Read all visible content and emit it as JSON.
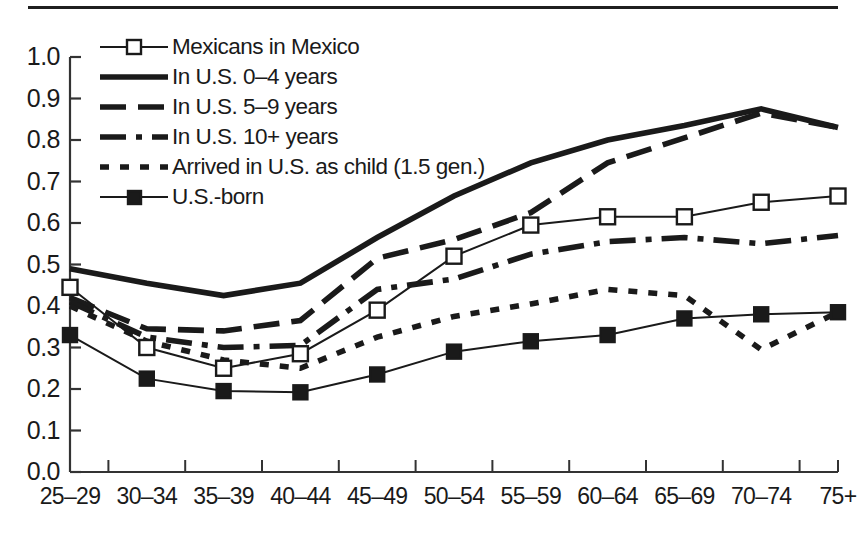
{
  "chart_data": {
    "type": "line",
    "title": "",
    "subtitle": "",
    "xlabel": "",
    "ylabel": "",
    "categories": [
      "25–29",
      "30–34",
      "35–39",
      "40–44",
      "45–49",
      "50–54",
      "55–59",
      "60–64",
      "65–69",
      "70–74",
      "75+"
    ],
    "ylim": [
      0.0,
      1.0
    ],
    "ytick_labels": [
      "0.0",
      "0.1",
      "0.2",
      "0.3",
      "0.4",
      "0.5",
      "0.6",
      "0.7",
      "0.8",
      "0.9",
      "1.0"
    ],
    "ytick_values": [
      0.0,
      0.1,
      0.2,
      0.3,
      0.4,
      0.5,
      0.6,
      0.7,
      0.8,
      0.9,
      1.0
    ],
    "grid": false,
    "legend_position": "upper-left-inside",
    "series": [
      {
        "name": "Mexicans in Mexico",
        "style": "solid-thin-open-square",
        "marker": "open-square",
        "values": [
          0.445,
          0.3,
          0.25,
          0.285,
          0.39,
          0.52,
          0.595,
          0.615,
          0.615,
          0.65,
          0.665
        ]
      },
      {
        "name": "In U.S. 0–4 years",
        "style": "solid-thick",
        "marker": "none",
        "values": [
          0.49,
          0.455,
          0.425,
          0.455,
          0.565,
          0.665,
          0.745,
          0.8,
          0.835,
          0.875,
          0.83
        ]
      },
      {
        "name": "In U.S. 5–9 years",
        "style": "dashed",
        "marker": "none",
        "values": [
          0.42,
          0.345,
          0.34,
          0.365,
          0.515,
          0.56,
          0.625,
          0.745,
          0.805,
          0.865,
          0.83
        ]
      },
      {
        "name": "In U.S. 10+ years",
        "style": "dash-dot",
        "marker": "none",
        "values": [
          0.41,
          0.325,
          0.3,
          0.305,
          0.44,
          0.465,
          0.525,
          0.555,
          0.565,
          0.55,
          0.57
        ]
      },
      {
        "name": "Arrived in U.S. as child (1.5 gen.)",
        "style": "dotted",
        "marker": "none",
        "values": [
          0.4,
          0.315,
          0.27,
          0.25,
          0.325,
          0.375,
          0.405,
          0.44,
          0.425,
          0.295,
          0.385
        ]
      },
      {
        "name": "U.S.-born",
        "style": "solid-thin-filled-square",
        "marker": "filled-square",
        "values": [
          0.33,
          0.225,
          0.195,
          0.192,
          0.235,
          0.29,
          0.315,
          0.33,
          0.37,
          0.38,
          0.385
        ]
      }
    ]
  },
  "colors": {
    "ink": "#1a1a1a",
    "axis": "#333333",
    "background": "#ffffff"
  }
}
